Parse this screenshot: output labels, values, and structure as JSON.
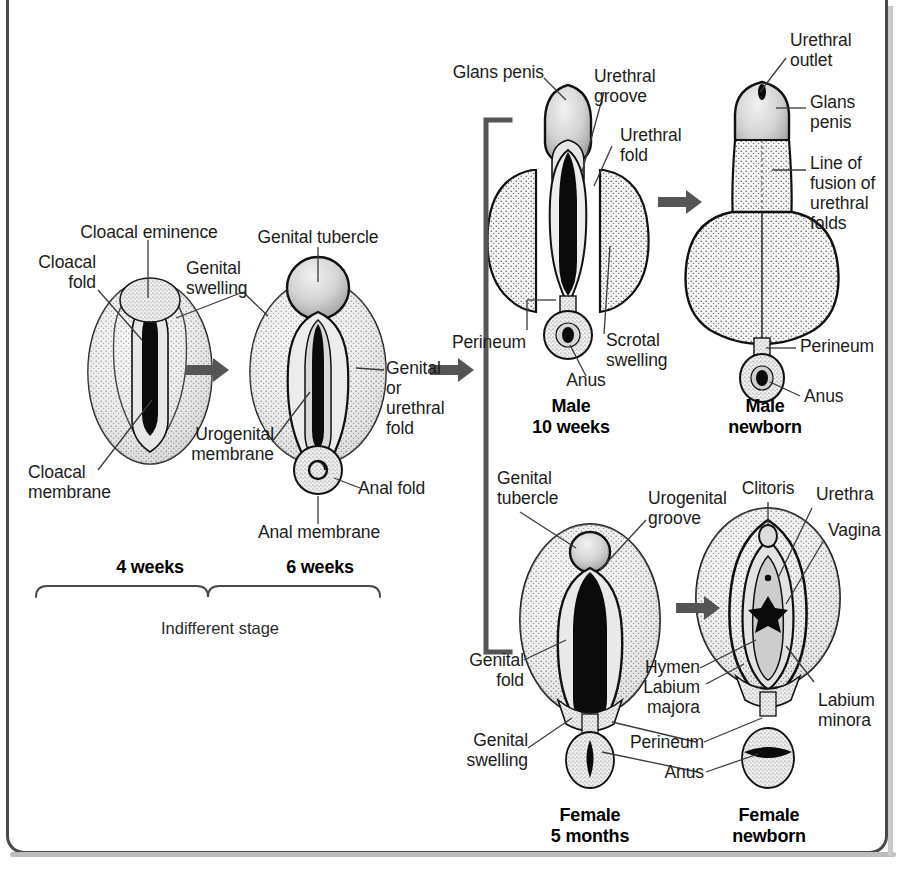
{
  "figure": {
    "frame_color": "#4a4a4a",
    "arrow_color": "#555555",
    "ink_color": "#111111"
  },
  "stages": {
    "four_weeks": {
      "caption": "4 weeks",
      "labels": [
        {
          "name": "cloacal-eminence",
          "text": "Cloacal eminence"
        },
        {
          "name": "cloacal-fold",
          "text": "Cloacal\nfold"
        },
        {
          "name": "cloacal-membrane",
          "text": "Cloacal\nmembrane"
        }
      ]
    },
    "six_weeks": {
      "caption": "6 weeks",
      "labels": [
        {
          "name": "genital-tubercle",
          "text": "Genital tubercle"
        },
        {
          "name": "genital-swelling",
          "text": "Genital\nswelling"
        },
        {
          "name": "urogenital-membrane",
          "text": "Urogenital\nmembrane"
        },
        {
          "name": "genital-or-urethral-fold",
          "text": "Genital\nor\nurethral\nfold"
        },
        {
          "name": "anal-fold",
          "text": "Anal fold"
        },
        {
          "name": "anal-membrane",
          "text": "Anal membrane"
        }
      ]
    },
    "male_ten_weeks": {
      "caption": "Male\n10 weeks",
      "labels": [
        {
          "name": "glans-penis",
          "text": "Glans penis"
        },
        {
          "name": "urethral-groove",
          "text": "Urethral\ngroove"
        },
        {
          "name": "urethral-fold",
          "text": "Urethral\nfold"
        },
        {
          "name": "perineum",
          "text": "Perineum"
        },
        {
          "name": "scrotal-swelling",
          "text": "Scrotal\nswelling"
        },
        {
          "name": "anus",
          "text": "Anus"
        }
      ]
    },
    "male_newborn": {
      "caption": "Male\nnewborn",
      "labels": [
        {
          "name": "urethral-outlet",
          "text": "Urethral\noutlet"
        },
        {
          "name": "glans-penis",
          "text": "Glans\npenis"
        },
        {
          "name": "line-of-fusion",
          "text": "Line of\nfusion of\nurethral\nfolds"
        },
        {
          "name": "perineum",
          "text": "Perineum"
        },
        {
          "name": "anus",
          "text": "Anus"
        }
      ]
    },
    "female_five_months": {
      "caption": "Female\n5 months",
      "labels": [
        {
          "name": "genital-tubercle",
          "text": "Genital\ntubercle"
        },
        {
          "name": "urogenital-groove",
          "text": "Urogenital\ngroove"
        },
        {
          "name": "genital-fold",
          "text": "Genital\nfold"
        },
        {
          "name": "genital-swelling",
          "text": "Genital\nswelling"
        }
      ]
    },
    "female_newborn": {
      "caption": "Female\nnewborn",
      "labels": [
        {
          "name": "clitoris",
          "text": "Clitoris"
        },
        {
          "name": "urethra",
          "text": "Urethra"
        },
        {
          "name": "vagina",
          "text": "Vagina"
        },
        {
          "name": "hymen",
          "text": "Hymen"
        },
        {
          "name": "labium-majora",
          "text": "Labium\nmajora"
        },
        {
          "name": "labium-minora",
          "text": "Labium\nminora"
        },
        {
          "name": "perineum",
          "text": "Perineum"
        },
        {
          "name": "anus",
          "text": "Anus"
        }
      ]
    }
  },
  "brackets": {
    "indifferent_stage": "Indifferent stage"
  }
}
